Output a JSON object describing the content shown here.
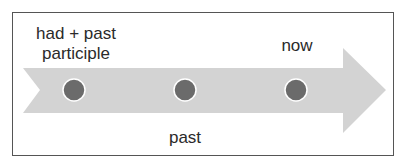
{
  "diagram": {
    "type": "timeline-arrow",
    "colors": {
      "arrow": "#d3d3d3",
      "dot": "#6b6b6b",
      "dot_stroke": "#ffffff",
      "frame": "#555555",
      "text": "#2a2a2a"
    },
    "points": [
      {
        "label": "had + past participle",
        "label_line1": "had + past",
        "label_line2": "participle",
        "position": "above"
      },
      {
        "label": "past",
        "position": "below"
      },
      {
        "label": "now",
        "position": "above"
      }
    ]
  }
}
